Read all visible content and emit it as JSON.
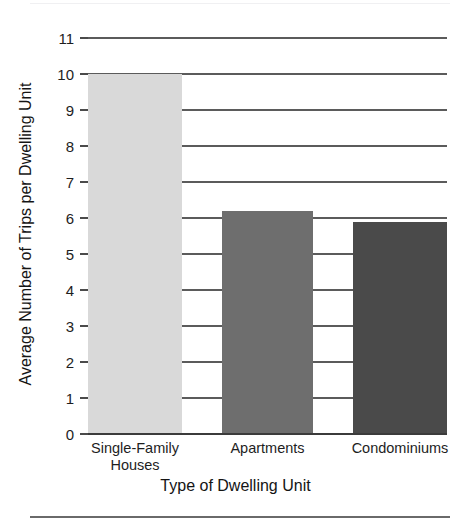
{
  "figure": {
    "top_rule_color": "#f0f0f2",
    "bottom_rule_color": "#6a6a6a"
  },
  "chart_data": {
    "type": "bar",
    "title": "",
    "xlabel": "Type of Dwelling Unit",
    "ylabel": "Average Number of Trips per Dwelling Unit",
    "categories": [
      "Single-Family Houses",
      "Apartments",
      "Condominiums"
    ],
    "category_lines": [
      [
        "Single-Family",
        "Houses"
      ],
      [
        "Apartments"
      ],
      [
        "Condominiums"
      ]
    ],
    "values": [
      10.0,
      6.2,
      5.9
    ],
    "bar_colors": [
      "#d9d9d9",
      "#6e6e6e",
      "#4a4a4a"
    ],
    "ylim": [
      0,
      11
    ],
    "ytick_labels": [
      "0",
      "1",
      "2",
      "3",
      "4",
      "5",
      "6",
      "7",
      "8",
      "9",
      "10",
      "11"
    ],
    "ytick_values": [
      0,
      1,
      2,
      3,
      4,
      5,
      6,
      7,
      8,
      9,
      10,
      11
    ],
    "grid": true,
    "grid_axis": "y",
    "gridline_color": "#5b5b5b",
    "legend": null,
    "legend_position": "none"
  }
}
